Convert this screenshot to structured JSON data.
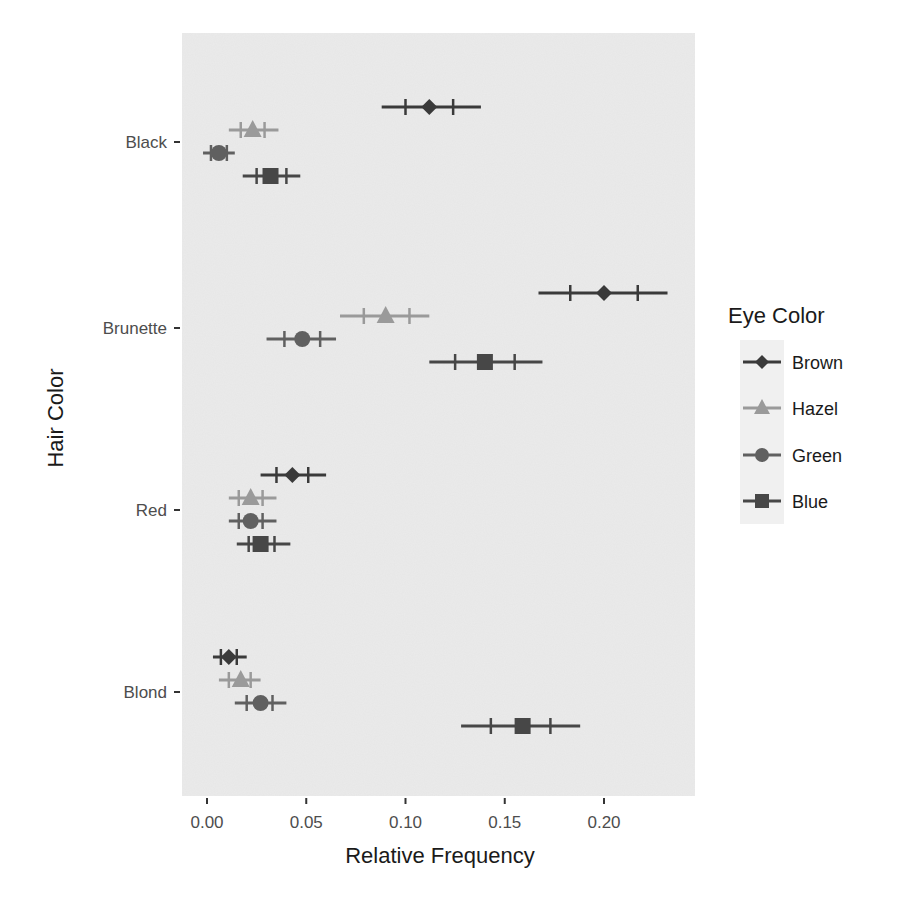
{
  "page": {
    "top_cropped_text": "THE CROPPED LINE ABOVE"
  },
  "chart_data": {
    "type": "scatter",
    "subtype": "dot-plot-with-error-bars",
    "title": "",
    "xlabel": "Relative Frequency",
    "ylabel": "Hair Color",
    "xlim": [
      -0.012,
      0.246
    ],
    "x_ticks": [
      0.0,
      0.05,
      0.1,
      0.15,
      0.2
    ],
    "x_tick_labels": [
      "0.00",
      "0.05",
      "0.10",
      "0.15",
      "0.20"
    ],
    "categories": [
      "Black",
      "Brunette",
      "Red",
      "Blond"
    ],
    "grid": false,
    "legend": {
      "title": "Eye Color",
      "position": "right",
      "entries": [
        "Brown",
        "Hazel",
        "Green",
        "Blue"
      ]
    },
    "series": [
      {
        "name": "Brown",
        "shape": "diamond",
        "color": "#3a3a3a",
        "values": [
          0.112,
          0.2,
          0.043,
          0.011
        ],
        "inner_low": [
          0.1,
          0.183,
          0.035,
          0.007
        ],
        "inner_high": [
          0.124,
          0.217,
          0.051,
          0.015
        ],
        "outer_low": [
          0.088,
          0.167,
          0.027,
          0.003
        ],
        "outer_high": [
          0.138,
          0.232,
          0.06,
          0.02
        ]
      },
      {
        "name": "Hazel",
        "shape": "triangle",
        "color": "#9a9a9a",
        "values": [
          0.023,
          0.09,
          0.022,
          0.017
        ],
        "inner_low": [
          0.017,
          0.079,
          0.016,
          0.011
        ],
        "inner_high": [
          0.029,
          0.102,
          0.028,
          0.022
        ],
        "outer_low": [
          0.011,
          0.067,
          0.011,
          0.006
        ],
        "outer_high": [
          0.036,
          0.112,
          0.035,
          0.027
        ]
      },
      {
        "name": "Green",
        "shape": "circle",
        "color": "#606060",
        "values": [
          0.006,
          0.048,
          0.022,
          0.027
        ],
        "inner_low": [
          0.002,
          0.039,
          0.016,
          0.02
        ],
        "inner_high": [
          0.01,
          0.057,
          0.028,
          0.033
        ],
        "outer_low": [
          -0.002,
          0.03,
          0.011,
          0.014
        ],
        "outer_high": [
          0.014,
          0.065,
          0.035,
          0.04
        ]
      },
      {
        "name": "Blue",
        "shape": "square",
        "color": "#474747",
        "values": [
          0.032,
          0.14,
          0.027,
          0.159
        ],
        "inner_low": [
          0.025,
          0.125,
          0.021,
          0.143
        ],
        "inner_high": [
          0.04,
          0.155,
          0.034,
          0.173
        ],
        "outer_low": [
          0.018,
          0.112,
          0.015,
          0.128
        ],
        "outer_high": [
          0.047,
          0.169,
          0.042,
          0.188
        ]
      }
    ]
  },
  "colors": {
    "panel_background": "#ebebeb",
    "tick_text": "#4d4d4d",
    "title_text": "#1a1a1a"
  }
}
